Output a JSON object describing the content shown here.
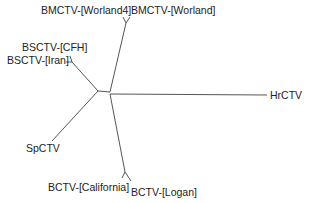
{
  "diagram": {
    "type": "unrooted phylogenetic tree",
    "line_color": "#555555",
    "labels": {
      "bmctv_worland4": "BMCTV-[Worland4]",
      "bmctv_worland": "BMCTV-[Worland]",
      "bsctv_cfh": "BSCTV-[CFH]",
      "bsctv_iran": "BSCTV-[Iran]",
      "hrctv": "HrCTV",
      "spctv": "SpCTV",
      "bctv_california": "BCTV-[California]",
      "bctv_logan": "BCTV-[Logan]"
    }
  }
}
